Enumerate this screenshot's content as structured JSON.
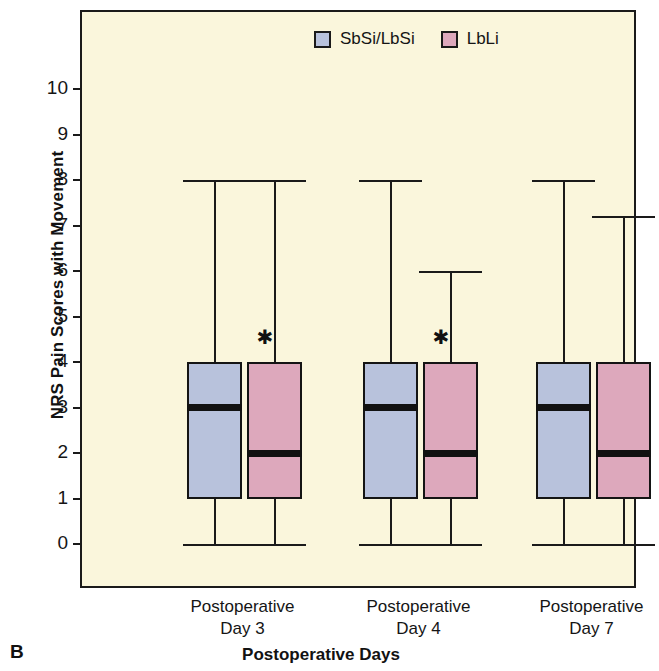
{
  "panel": {
    "label": "B"
  },
  "chart_data": {
    "type": "box",
    "title": "",
    "xlabel": "Postoperative Days",
    "ylabel": "NRS Pain Scores with Movement",
    "ylim": [
      0,
      10.6
    ],
    "yticks": [
      0,
      1,
      2,
      3,
      4,
      5,
      6,
      7,
      8,
      9,
      10
    ],
    "ytick_labels": [
      "0",
      "1",
      "2",
      "3",
      "4",
      "5",
      "6",
      "7",
      "8",
      "9",
      "10"
    ],
    "grid": false,
    "legend_position": "top-center",
    "categories": [
      "Postoperative Day 3",
      "Postoperative Day 4",
      "Postoperative Day 7"
    ],
    "category_lines": [
      [
        "Postoperative",
        "Day 3"
      ],
      [
        "Postoperative",
        "Day 4"
      ],
      [
        "Postoperative",
        "Day 7"
      ]
    ],
    "series": [
      {
        "name": "SbSi/LbSi",
        "color": "#b8c2dc",
        "boxes": [
          {
            "category": "Postoperative Day 3",
            "whisker_low": 0,
            "q1": 1,
            "median": 3,
            "q3": 4,
            "whisker_high": 8,
            "significant": false
          },
          {
            "category": "Postoperative Day 4",
            "whisker_low": 0,
            "q1": 1,
            "median": 3,
            "q3": 4,
            "whisker_high": 8,
            "significant": false
          },
          {
            "category": "Postoperative Day 7",
            "whisker_low": 0,
            "q1": 1,
            "median": 3,
            "q3": 4,
            "whisker_high": 8,
            "significant": false
          }
        ]
      },
      {
        "name": "LbLi",
        "color": "#dda8bc",
        "boxes": [
          {
            "category": "Postoperative Day 3",
            "whisker_low": 0,
            "q1": 1,
            "median": 2,
            "q3": 4,
            "whisker_high": 8,
            "significant": true
          },
          {
            "category": "Postoperative Day 4",
            "whisker_low": 0,
            "q1": 1,
            "median": 2,
            "q3": 4,
            "whisker_high": 6,
            "significant": true
          },
          {
            "category": "Postoperative Day 7",
            "whisker_low": 0,
            "q1": 1,
            "median": 2,
            "q3": 4,
            "whisker_high": 7.2,
            "significant": false
          }
        ]
      }
    ],
    "annotations": [
      {
        "symbol": "✱",
        "category": "Postoperative Day 3",
        "series": "LbLi",
        "value": 4.55
      },
      {
        "symbol": "✱",
        "category": "Postoperative Day 4",
        "series": "LbLi",
        "value": 4.55
      }
    ],
    "colors": {
      "plot_background": "#faf6dc",
      "axis": "#1a1a1a",
      "series_sbsi_lbsi": "#b8c2dc",
      "series_lbli": "#dda8bc",
      "median": "#111111"
    }
  }
}
